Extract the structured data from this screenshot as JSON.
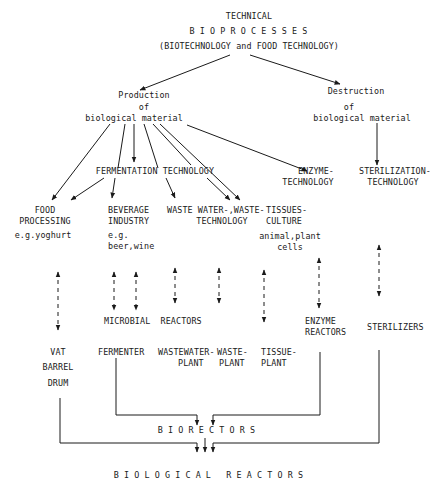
{
  "title": {
    "line1": "TECHNICAL",
    "line2": "BIOPROCESSES",
    "line3": "(BIOTECHNOLOGY and FOOD TECHNOLOGY)"
  },
  "level1": {
    "production": {
      "line1": "Production",
      "line2": "of",
      "line3": "biological material"
    },
    "destruction": {
      "line1": "Destruction",
      "line2": "of",
      "line3": "biological material"
    }
  },
  "level2": {
    "fermentation": "FERMENTATION TECHNOLOGY",
    "enzyme_technology": {
      "line1": "ENZYME-",
      "line2": "TECHNOLOGY"
    },
    "sterilization_technology": {
      "line1": "STERILIZATION-",
      "line2": "TECHNOLOGY"
    }
  },
  "level3": {
    "food_processing": {
      "line1": "FOOD",
      "line2": "PROCESSING",
      "example": "e.g.yoghurt"
    },
    "beverage_industry": {
      "line1": "BEVERAGE",
      "line2": "INDUSTRY",
      "example1": "e.g.",
      "example2": "beer,wine"
    },
    "waste_water": {
      "line1": "WASTE WATER-,WASTE-",
      "line2": "TECHNOLOGY"
    },
    "tissues_culture": {
      "line1": "TISSUES-",
      "line2": "CULTURE",
      "example1": "animal,plant",
      "example2": "cells"
    }
  },
  "reactors": {
    "microbial_reactors": "MICROBIAL  REACTORS",
    "enzyme_reactors": {
      "line1": "ENZYME",
      "line2": "REACTORS"
    },
    "sterilizers": "STERILIZERS"
  },
  "equipment": {
    "vat": "VAT",
    "barrel": "BARREL",
    "drum": "DRUM",
    "fermenter": "FERMENTER",
    "wastewater_plant": {
      "line1": "WASTEWATER-",
      "line2": "PLANT"
    },
    "waste_plant": {
      "line1": "WASTE-",
      "line2": "PLANT"
    },
    "tissue_plant": {
      "line1": "TISSUE-",
      "line2": "PLANT"
    }
  },
  "bottom": {
    "biorectors": "BIORECTORS",
    "biological_reactors": "BIOLOGICAL REACTORS"
  },
  "colors": {
    "ink": "#1a1a1a",
    "background": "#ffffff"
  }
}
